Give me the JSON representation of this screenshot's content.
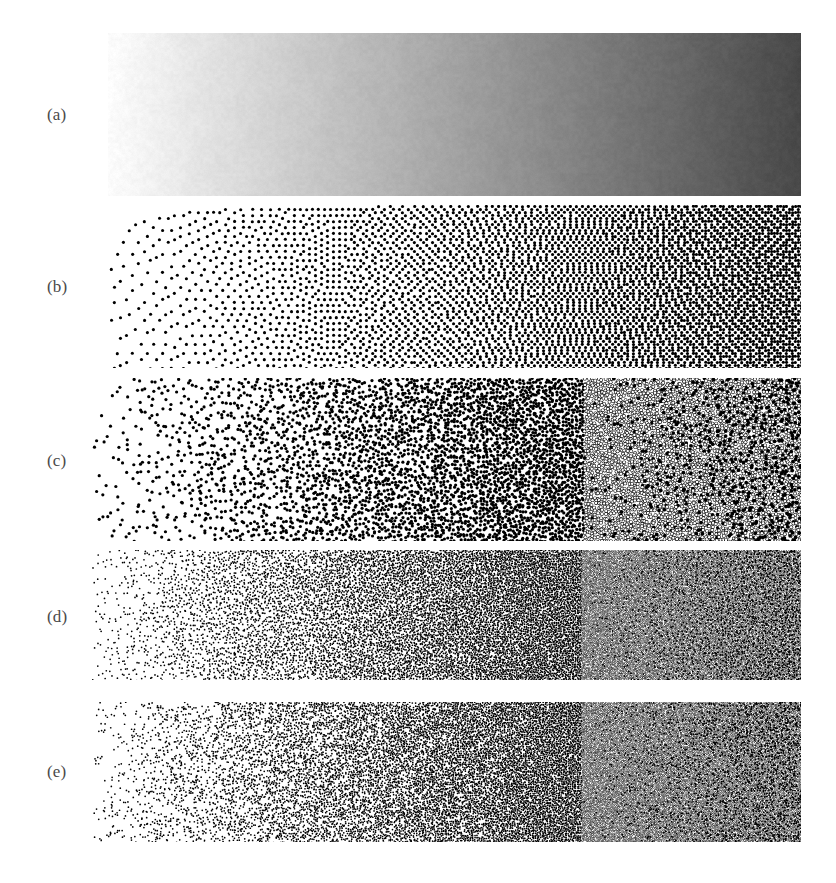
{
  "figure": {
    "background_color": "#ffffff",
    "width": 836,
    "height": 883,
    "label_color": "#4a4a4a",
    "ink_color": "#000000",
    "panel_left": 92,
    "panel_right": 801,
    "label_x": 47
  },
  "source_image": {
    "description": "Horizontal linear grayscale ramp, light at the left edge and dark at the right edge",
    "gradient_start_gray": "#fdfdfd",
    "gradient_end_gray": "#474747",
    "gradient_start_value": 0.99,
    "gradient_end_value": 0.28,
    "direction": "left-to-right light-to-dark"
  },
  "panels": [
    {
      "label": "(a)",
      "name": "continuous-tone-ramp",
      "caption": "Original continuous-tone grayscale ramp",
      "method": "continuous",
      "x": 108,
      "y": 33,
      "width": 693,
      "height": 163,
      "label_y": 106,
      "dot_radius": 0,
      "noise": 0.012,
      "invert_threshold": 1.0
    },
    {
      "label": "(b)",
      "name": "error-diffusion-dither",
      "caption": "Floyd-Steinberg error diffusion with structured worm artifacts",
      "method": "error-diffusion",
      "x": 92,
      "y": 205,
      "width": 709,
      "height": 163,
      "label_y": 278,
      "dot_radius": 1.55,
      "noise": 0.02,
      "invert_threshold": 0.5
    },
    {
      "label": "(c)",
      "name": "blue-noise-stipple-coarse",
      "caption": "Blue-noise stippling, coarse dot size",
      "method": "blue-noise",
      "x": 92,
      "y": 378,
      "width": 709,
      "height": 163,
      "label_y": 452,
      "dot_radius": 1.6,
      "noise": 0.0,
      "invert_threshold": 0.5
    },
    {
      "label": "(d)",
      "name": "blue-noise-stipple-fine",
      "caption": "Blue-noise stippling, fine dot size",
      "method": "blue-noise",
      "x": 92,
      "y": 550,
      "width": 709,
      "height": 130,
      "label_y": 608,
      "dot_radius": 0.85,
      "noise": 0.0,
      "invert_threshold": 0.5
    },
    {
      "label": "(e)",
      "name": "white-noise-stipple-fine",
      "caption": "Random (white-noise) stippling, fine dot size",
      "method": "white-noise",
      "x": 92,
      "y": 702,
      "width": 709,
      "height": 140,
      "label_y": 763,
      "dot_radius": 0.85,
      "noise": 0.0,
      "invert_threshold": 0.5
    }
  ]
}
